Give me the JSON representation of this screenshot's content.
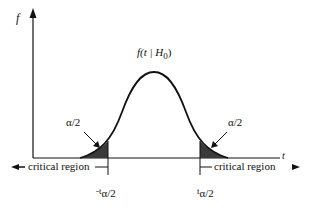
{
  "diagram": {
    "y_axis_label": "f",
    "x_axis_label": "t",
    "curve_label": {
      "prefix": "f(t | H",
      "subscript": "0",
      "suffix": ")"
    },
    "tail_label_left": "α/2",
    "tail_label_right": "α/2",
    "critical_region_left": "critical region",
    "critical_region_right": "critical region",
    "cutoff_left": {
      "prefix": "-t",
      "subscript": "α/2"
    },
    "cutoff_right": {
      "prefix": "t",
      "subscript": "α/2"
    },
    "colors": {
      "line": "#111111",
      "shade": "#3a3a3a"
    }
  }
}
